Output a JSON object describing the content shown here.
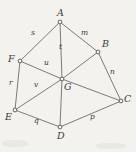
{
  "figure": {
    "background_color": "#f4f2ee",
    "ink_color": "#5d5a57",
    "width": 136,
    "height": 152
  },
  "chart_data": {
    "type": "diagram",
    "title": "",
    "subtitle": "",
    "nodes": [
      {
        "id": "A",
        "label": "A",
        "x": 60,
        "y": 22,
        "label_x": 57,
        "label_y": 8
      },
      {
        "id": "B",
        "label": "B",
        "x": 98,
        "y": 52,
        "label_x": 102,
        "label_y": 39
      },
      {
        "id": "C",
        "label": "C",
        "x": 121,
        "y": 101,
        "label_x": 124,
        "label_y": 94
      },
      {
        "id": "D",
        "label": "D",
        "x": 60,
        "y": 127,
        "label_x": 57,
        "label_y": 131
      },
      {
        "id": "E",
        "label": "E",
        "x": 15,
        "y": 110,
        "label_x": 5,
        "label_y": 112
      },
      {
        "id": "F",
        "label": "F",
        "x": 20,
        "y": 61,
        "label_x": 8,
        "label_y": 54
      },
      {
        "id": "G",
        "label": "G",
        "x": 62,
        "y": 79,
        "label_x": 64,
        "label_y": 82
      }
    ],
    "edges": [
      {
        "id": "edge-s",
        "from": "F",
        "to": "A",
        "label": "s",
        "label_x": 31,
        "label_y": 29
      },
      {
        "id": "edge-m",
        "from": "A",
        "to": "B",
        "label": "m",
        "label_x": 81,
        "label_y": 29
      },
      {
        "id": "edge-n",
        "from": "B",
        "to": "C",
        "label": "n",
        "label_x": 110,
        "label_y": 68
      },
      {
        "id": "edge-p",
        "from": "C",
        "to": "D",
        "label": "p",
        "label_x": 90,
        "label_y": 113
      },
      {
        "id": "edge-q",
        "from": "D",
        "to": "E",
        "label": "q",
        "label_x": 34,
        "label_y": 117
      },
      {
        "id": "edge-r",
        "from": "E",
        "to": "F",
        "label": "r",
        "label_x": 9,
        "label_y": 79
      },
      {
        "id": "edge-t",
        "from": "A",
        "to": "G",
        "label": "t",
        "label_x": 59,
        "label_y": 43
      },
      {
        "id": "edge-u",
        "from": "F",
        "to": "G",
        "label": "u",
        "label_x": 44,
        "label_y": 59
      },
      {
        "id": "edge-v",
        "from": "E",
        "to": "G",
        "label": "v",
        "label_x": 34,
        "label_y": 81
      },
      {
        "id": "edge-gb",
        "from": "G",
        "to": "B",
        "label": "",
        "label_x": 0,
        "label_y": 0
      },
      {
        "id": "edge-gc",
        "from": "G",
        "to": "C",
        "label": "",
        "label_x": 0,
        "label_y": 0
      },
      {
        "id": "edge-gd",
        "from": "G",
        "to": "D",
        "label": "",
        "label_x": 0,
        "label_y": 0
      }
    ],
    "vertex_labels": [
      "A",
      "B",
      "C",
      "D",
      "E",
      "F",
      "G"
    ],
    "edge_labels": [
      "m",
      "n",
      "p",
      "q",
      "r",
      "s",
      "t",
      "u",
      "v"
    ]
  }
}
